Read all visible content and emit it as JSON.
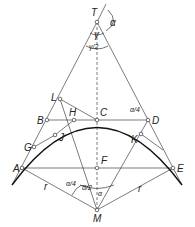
{
  "diagram": {
    "points": {
      "T": "T",
      "L": "L",
      "B": "B",
      "H": "H",
      "C": "C",
      "D": "D",
      "J": "J",
      "K": "K",
      "G": "G",
      "A": "A",
      "F": "F",
      "E": "E",
      "M": "M"
    },
    "angles": {
      "alpha": "α",
      "gamma": "γ",
      "gamma_half": "γ/2",
      "alpha_quarter": "α/4",
      "alpha_half": "α/2"
    },
    "radius_label": "r",
    "colors": {
      "line": "#333333",
      "arc": "#111111"
    }
  }
}
